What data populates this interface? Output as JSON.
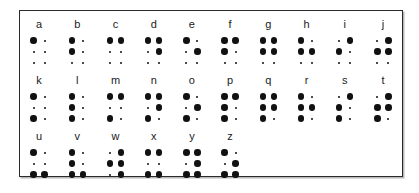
{
  "frame": {
    "border_color": "#2b2b2b",
    "background_color": "#ffffff",
    "shadow_color": "#b8b8b8"
  },
  "dot_colors": {
    "filled": "#111111",
    "empty": "#111111"
  },
  "legend": {
    "dot_positions": [
      "1",
      "4",
      "2",
      "5",
      "3",
      "6"
    ],
    "note": "Each cell is a 2-column by 3-row braille grid; large dots are raised, small dots are unraised."
  },
  "rows": [
    {
      "row_index": 0,
      "cells": [
        {
          "letter": "a",
          "dots": [
            1
          ]
        },
        {
          "letter": "b",
          "dots": [
            1,
            2
          ]
        },
        {
          "letter": "c",
          "dots": [
            1,
            4
          ]
        },
        {
          "letter": "d",
          "dots": [
            1,
            4,
            5
          ]
        },
        {
          "letter": "e",
          "dots": [
            1,
            5
          ]
        },
        {
          "letter": "f",
          "dots": [
            1,
            2,
            4
          ]
        },
        {
          "letter": "g",
          "dots": [
            1,
            2,
            4,
            5
          ]
        },
        {
          "letter": "h",
          "dots": [
            1,
            2,
            5
          ]
        },
        {
          "letter": "i",
          "dots": [
            2,
            4
          ]
        },
        {
          "letter": "j",
          "dots": [
            2,
            4,
            5
          ]
        }
      ]
    },
    {
      "row_index": 1,
      "cells": [
        {
          "letter": "k",
          "dots": [
            1,
            3
          ]
        },
        {
          "letter": "l",
          "dots": [
            1,
            2,
            3
          ]
        },
        {
          "letter": "m",
          "dots": [
            1,
            3,
            4
          ]
        },
        {
          "letter": "n",
          "dots": [
            1,
            3,
            4,
            5
          ]
        },
        {
          "letter": "o",
          "dots": [
            1,
            3,
            5
          ]
        },
        {
          "letter": "p",
          "dots": [
            1,
            2,
            3,
            4
          ]
        },
        {
          "letter": "q",
          "dots": [
            1,
            2,
            3,
            4,
            5
          ]
        },
        {
          "letter": "r",
          "dots": [
            1,
            2,
            3,
            5
          ]
        },
        {
          "letter": "s",
          "dots": [
            2,
            3,
            4
          ]
        },
        {
          "letter": "t",
          "dots": [
            2,
            3,
            4,
            5
          ]
        }
      ]
    },
    {
      "row_index": 2,
      "cells": [
        {
          "letter": "u",
          "dots": [
            1,
            3,
            6
          ]
        },
        {
          "letter": "v",
          "dots": [
            1,
            2,
            3,
            6
          ]
        },
        {
          "letter": "w",
          "dots": [
            2,
            4,
            5,
            6
          ]
        },
        {
          "letter": "x",
          "dots": [
            1,
            3,
            4,
            6
          ]
        },
        {
          "letter": "y",
          "dots": [
            1,
            3,
            4,
            5,
            6
          ]
        },
        {
          "letter": "z",
          "dots": [
            1,
            3,
            5,
            6
          ]
        },
        {
          "letter": "",
          "dots": []
        },
        {
          "letter": "",
          "dots": []
        },
        {
          "letter": "",
          "dots": []
        },
        {
          "letter": "",
          "dots": []
        }
      ]
    }
  ]
}
